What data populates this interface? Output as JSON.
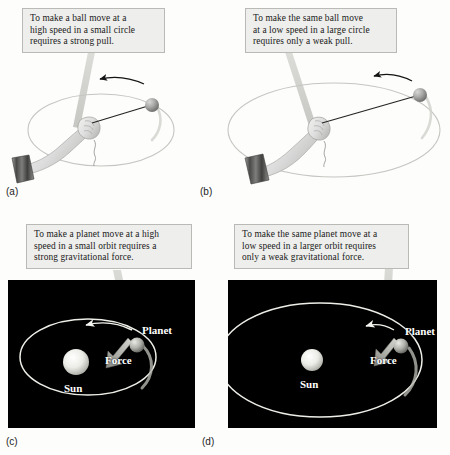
{
  "figure": {
    "background_color": "#fdfdfc",
    "callout_bg": "#eeeeec",
    "callout_border": "#b9b9b5",
    "space_bg": "#000000",
    "orbit_stroke": "#f2f2ee",
    "string_stroke": "#2b2b2b"
  },
  "panels": [
    {
      "id": "a",
      "letter": "(a)",
      "callout": "To make a ball move at a high speed in a small circle requires a strong pull.",
      "callout_lines": [
        "To make a ball move at a",
        "high speed in a small circle",
        "requires a strong pull."
      ]
    },
    {
      "id": "b",
      "letter": "(b)",
      "callout": "To make the same ball move at a low speed in a large circle requires only a weak pull.",
      "callout_lines": [
        "To make the same ball move",
        "at a low speed in a large circle",
        "requires only a weak pull."
      ]
    },
    {
      "id": "c",
      "letter": "(c)",
      "callout": "To make a planet move at a high speed in a small orbit requires a strong gravitational force.",
      "callout_lines": [
        "To make a planet move at a high",
        "speed in a small orbit requires a",
        "strong gravitational force."
      ],
      "labels": {
        "planet": "Planet",
        "force": "Force",
        "sun": "Sun"
      }
    },
    {
      "id": "d",
      "letter": "(d)",
      "callout": "To make the same planet move at a low speed in a larger orbit requires only a weak gravitational force.",
      "callout_lines": [
        "To make the same planet move at a",
        "low speed in a larger orbit requires",
        "only a weak gravitational force."
      ],
      "labels": {
        "planet": "Planet",
        "force": "Force",
        "sun": "Sun"
      }
    }
  ],
  "icons": {
    "motion_arrow": "motion-direction-arrow",
    "force_arrow": "gravitational-force-arrow",
    "ball": "ball-on-string",
    "hand": "hand-holding-string",
    "sun": "sun-sphere",
    "planet": "planet-sphere"
  }
}
